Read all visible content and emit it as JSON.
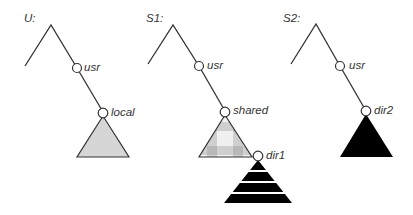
{
  "diagram": {
    "trees": [
      {
        "label": "U:",
        "nodes": [
          "usr",
          "local"
        ],
        "subtree_fill": "gray"
      },
      {
        "label": "S1:",
        "nodes": [
          "usr",
          "shared",
          "dir1"
        ],
        "subtree_fill": "checkered",
        "nested_subtree_fill": "black-striped"
      },
      {
        "label": "S2:",
        "nodes": [
          "usr",
          "dir2"
        ],
        "subtree_fill": "black"
      }
    ]
  },
  "colors": {
    "line": "#333333",
    "gray_fill": "#d6d6d6",
    "black_fill": "#000000"
  }
}
